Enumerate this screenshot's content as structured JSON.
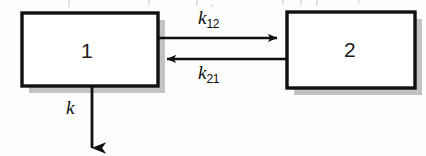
{
  "diagram": {
    "type": "two-compartment-pharmacokinetic-model",
    "background_color": "#fdfdfd",
    "stroke_color": "#111111",
    "shadow_color": "#b8b8b8",
    "compartments": [
      {
        "id": "compartment-1",
        "label": "1",
        "x": 22,
        "y": 13,
        "width": 136,
        "height": 73
      },
      {
        "id": "compartment-2",
        "label": "2",
        "x": 287,
        "y": 12,
        "width": 128,
        "height": 76
      }
    ],
    "arrows": [
      {
        "id": "arrow-k12",
        "direction": "right",
        "from": "compartment-1",
        "to": "compartment-2",
        "label": "k",
        "subscript": "12"
      },
      {
        "id": "arrow-k21",
        "direction": "left",
        "from": "compartment-2",
        "to": "compartment-1",
        "label": "k",
        "subscript": "21"
      },
      {
        "id": "arrow-k-elimination",
        "direction": "down",
        "from": "compartment-1",
        "to": "external",
        "label": "k",
        "subscript": ""
      }
    ]
  }
}
